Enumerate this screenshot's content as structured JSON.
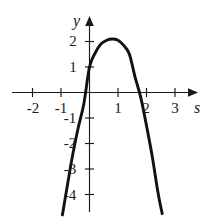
{
  "chart_data": {
    "type": "line",
    "title": "",
    "subtitle": "",
    "xlabel": "s",
    "ylabel": "y",
    "grid": false,
    "legend": null,
    "xlim": [
      -2.7,
      3.6
    ],
    "ylim": [
      -5.0,
      2.6
    ],
    "x_ticks": [
      -2,
      -1,
      1,
      2,
      3
    ],
    "x_tick_labels": [
      "-2",
      "-1",
      "1",
      "2",
      "3"
    ],
    "y_ticks": [
      1,
      2,
      -1,
      -2,
      -3,
      -4
    ],
    "y_tick_labels": [
      "1",
      "2",
      "-1",
      "-2",
      "-3",
      "-4"
    ],
    "annotations": [],
    "series": [
      {
        "name": "parabola",
        "color": "#111111",
        "description": "downward-opening parabola",
        "vertex": [
          0.82,
          2.1
        ],
        "y_intercept": 1.0,
        "roots": [
          -0.1,
          1.75
        ],
        "x": [
          -0.95,
          -0.8,
          -0.6,
          -0.4,
          -0.2,
          0.0,
          0.2,
          0.4,
          0.6,
          0.8,
          1.0,
          1.2,
          1.4,
          1.6,
          1.8,
          2.0,
          2.2,
          2.4,
          2.55
        ],
        "values": [
          -4.8,
          -3.8,
          -2.5,
          -1.4,
          -0.45,
          1.0,
          1.55,
          1.9,
          2.05,
          2.1,
          2.05,
          1.85,
          1.5,
          0.6,
          -0.2,
          -1.3,
          -2.5,
          -3.9,
          -4.75
        ]
      }
    ]
  },
  "labels": {
    "y_axis_name": "y",
    "x_axis_name": "s",
    "y2": "2",
    "y1": "1",
    "ym1": "-1",
    "ym2": "-2",
    "ym3": "-3",
    "ym4": "-4",
    "xm2": "-2",
    "xm1": "-1",
    "x1": "1",
    "x2": "2",
    "x3": "3"
  },
  "colors": {
    "curve": "#111111",
    "axis": "#1a1a1a",
    "background": "#ffffff"
  }
}
